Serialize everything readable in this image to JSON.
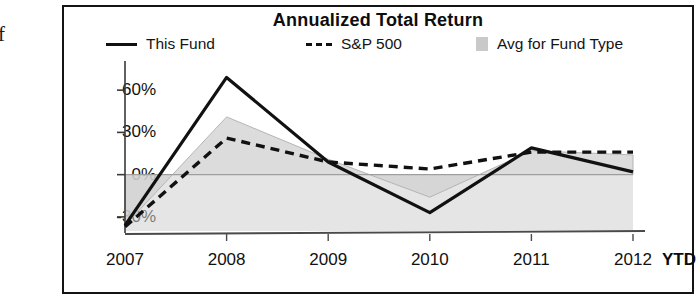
{
  "edge_artifact": "f",
  "chart": {
    "title": "Annualized Total Return",
    "legend": [
      {
        "label": "This Fund",
        "marker": "solid-line-swatch",
        "color": "#111111"
      },
      {
        "label": "S&P 500",
        "marker": "dashed-line-swatch",
        "color": "#111111"
      },
      {
        "label": "Avg for Fund Type",
        "marker": "gray-square-swatch",
        "color": "#c9c9c9"
      }
    ],
    "ytd_note": "YTD"
  },
  "chart_data": {
    "type": "line",
    "title": "Annualized Total Return",
    "xlabel": "",
    "ylabel": "",
    "x": [
      "2007",
      "2008",
      "2009",
      "2010",
      "2011",
      "2012"
    ],
    "categories": [
      "2007",
      "2008",
      "2009",
      "2010",
      "2011",
      "2012"
    ],
    "ylim": [
      -40,
      75
    ],
    "yticks": [
      -30,
      0,
      30,
      60
    ],
    "ytick_labels": [
      "-30%",
      "0%",
      "30%",
      "60%"
    ],
    "grid": false,
    "legend_position": "top",
    "series": [
      {
        "name": "This Fund",
        "style": "solid",
        "color": "#111111",
        "values": [
          -36,
          69,
          9,
          -27,
          19,
          2
        ]
      },
      {
        "name": "S&P 500",
        "style": "dashed",
        "color": "#111111",
        "values": [
          -37,
          26,
          9,
          4,
          16,
          16
        ]
      },
      {
        "name": "Avg for Fund Type",
        "style": "filled-area",
        "color": "#d0d0d0",
        "values": [
          -36,
          41,
          11,
          -16,
          17,
          14
        ]
      }
    ],
    "annotations": [
      "YTD"
    ]
  }
}
